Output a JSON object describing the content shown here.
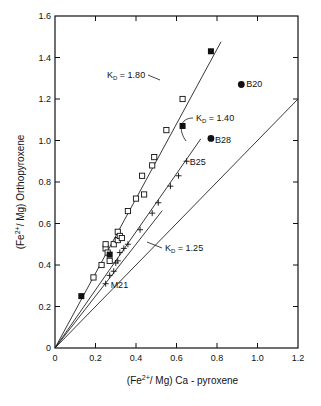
{
  "chart_data": {
    "type": "scatter",
    "title": "",
    "xlabel": "(Fe2+/Mg) Ca-pyroxene",
    "ylabel": "(Fe2+/Mg) Orthopyroxene",
    "xlim": [
      0,
      1.2
    ],
    "ylim": [
      0,
      1.6
    ],
    "xticks": [
      "0",
      "0.2",
      "0.4",
      "0.6",
      "0.8",
      "1.0",
      "1.2"
    ],
    "yticks": [
      "0",
      "0.2",
      "0.4",
      "0.6",
      "0.8",
      "1.0",
      "1.2",
      "1.4",
      "1.6"
    ],
    "grid": false,
    "lines": [
      {
        "name": "KD = 1.80",
        "slope": 1.8,
        "x_end": 0.82
      },
      {
        "name": "KD = 1.40",
        "slope": 1.4,
        "x_end": 0.72
      },
      {
        "name": "KD = 1.25",
        "slope": 1.25,
        "x_end": 0.53
      },
      {
        "name": "1:1",
        "slope": 1.0,
        "x_end": 1.2
      }
    ],
    "series": [
      {
        "name": "open-squares",
        "marker": "open-square",
        "points": [
          [
            0.19,
            0.34
          ],
          [
            0.23,
            0.4
          ],
          [
            0.25,
            0.48
          ],
          [
            0.25,
            0.5
          ],
          [
            0.26,
            0.46
          ],
          [
            0.27,
            0.42
          ],
          [
            0.29,
            0.5
          ],
          [
            0.31,
            0.52
          ],
          [
            0.31,
            0.56
          ],
          [
            0.32,
            0.54
          ],
          [
            0.33,
            0.53
          ],
          [
            0.36,
            0.66
          ],
          [
            0.4,
            0.72
          ],
          [
            0.44,
            0.74
          ],
          [
            0.43,
            0.83
          ],
          [
            0.48,
            0.88
          ],
          [
            0.49,
            0.92
          ],
          [
            0.55,
            1.05
          ],
          [
            0.63,
            1.2
          ]
        ]
      },
      {
        "name": "filled-squares",
        "marker": "filled-square",
        "points": [
          [
            0.13,
            0.25
          ],
          [
            0.27,
            0.45
          ],
          [
            0.63,
            1.07
          ],
          [
            0.77,
            1.43
          ]
        ]
      },
      {
        "name": "crosses",
        "marker": "cross",
        "points": [
          [
            0.25,
            0.31
          ],
          [
            0.27,
            0.35
          ],
          [
            0.29,
            0.37
          ],
          [
            0.3,
            0.41
          ],
          [
            0.31,
            0.42
          ],
          [
            0.32,
            0.46
          ],
          [
            0.34,
            0.48
          ],
          [
            0.36,
            0.5
          ],
          [
            0.42,
            0.57
          ],
          [
            0.48,
            0.65
          ],
          [
            0.51,
            0.7
          ],
          [
            0.57,
            0.78
          ],
          [
            0.61,
            0.83
          ],
          [
            0.65,
            0.9
          ]
        ]
      },
      {
        "name": "filled-circles",
        "marker": "filled-circle",
        "points": [
          [
            0.92,
            1.27
          ],
          [
            0.77,
            1.01
          ]
        ]
      }
    ],
    "annotations": [
      {
        "text": "B20",
        "x": 0.92,
        "y": 1.27
      },
      {
        "text": "B28",
        "x": 0.77,
        "y": 1.01
      },
      {
        "text": "B25",
        "x": 0.65,
        "y": 0.9
      },
      {
        "text": "M21",
        "x": 0.25,
        "y": 0.31
      },
      {
        "text": "KD = 1.80",
        "x": 0.45,
        "y": 1.3
      },
      {
        "text": "KD = 1.40",
        "x": 0.68,
        "y": 1.1
      },
      {
        "text": "KD = 1.25",
        "x": 0.57,
        "y": 0.55
      }
    ]
  }
}
